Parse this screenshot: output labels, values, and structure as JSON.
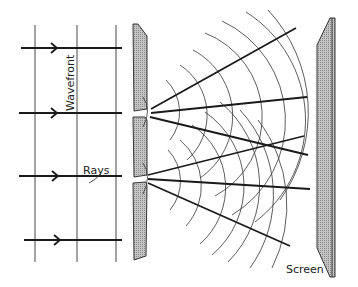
{
  "diagram": {
    "labels": {
      "wavefront": "Wavefront",
      "rays": "Rays",
      "screen": "Screen"
    },
    "colors": {
      "ink": "#1a1a1a",
      "barrier_fill": "#b8b8b8",
      "background": "#ffffff"
    },
    "incoming": {
      "wavefront_lines_x": [
        35,
        77,
        116
      ],
      "ray_arrows_y": [
        48,
        113,
        176,
        240
      ]
    },
    "barrier": {
      "slit_count": 2,
      "slit_y": [
        113,
        179
      ]
    },
    "screen": {
      "position": "right"
    }
  }
}
